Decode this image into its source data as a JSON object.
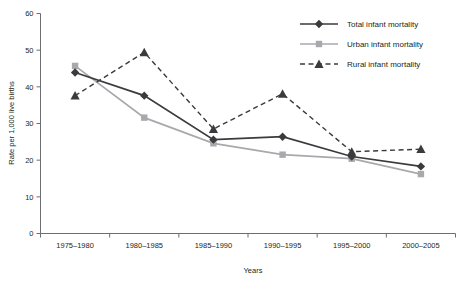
{
  "chart_data": {
    "type": "line",
    "title": "",
    "xlabel": "Years",
    "ylabel": "Rate per 1,000 live births",
    "categories": [
      "1975–1980",
      "1980–1985",
      "1985–1990",
      "1990–1995",
      "1995–2000",
      "2000–2005"
    ],
    "ylim": [
      0,
      60
    ],
    "yticks": [
      0,
      10,
      20,
      30,
      40,
      50,
      60
    ],
    "ytick_labels": [
      "0",
      "10",
      "20",
      "30",
      "40",
      "50",
      "60"
    ],
    "grid": false,
    "legend_position": "top-right",
    "series": [
      {
        "name": "Total infant mortality",
        "values": [
          43.9,
          37.6,
          25.6,
          26.4,
          21.0,
          18.3
        ],
        "color": "#3b3b3d",
        "marker": "diamond",
        "dash": "solid"
      },
      {
        "name": "Urban infant mortality",
        "values": [
          45.7,
          31.6,
          24.6,
          21.5,
          20.4,
          16.2
        ],
        "color": "#a7a9ac",
        "marker": "square",
        "dash": "solid"
      },
      {
        "name": "Rural infant mortality",
        "values": [
          37.6,
          49.4,
          28.5,
          38.1,
          22.3,
          23.0
        ],
        "color": "#3b3b3d",
        "marker": "triangle",
        "dash": "dashed"
      }
    ]
  },
  "legend": {
    "items": [
      {
        "label": "Total infant mortality"
      },
      {
        "label": "Urban infant mortality"
      },
      {
        "label": "Rural infant mortality"
      }
    ]
  },
  "axes": {
    "x_title": "Years",
    "y_title": "Rate per 1,000 live births"
  }
}
